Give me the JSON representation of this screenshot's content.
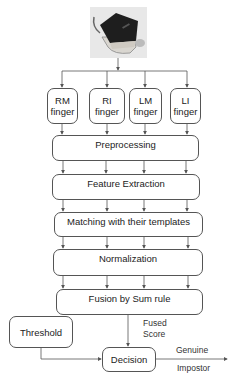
{
  "diagram": {
    "type": "flowchart",
    "input": {
      "name": "fingerprint-scanner-image"
    },
    "fingers": [
      {
        "line1": "RM",
        "line2": "finger"
      },
      {
        "line1": "RI",
        "line2": "finger"
      },
      {
        "line1": "LM",
        "line2": "finger"
      },
      {
        "line1": "LI",
        "line2": "finger"
      }
    ],
    "stages": [
      "Preprocessing",
      "Feature Extraction",
      "Matching with their templates",
      "Normalization",
      "Fusion by Sum rule"
    ],
    "threshold": "Threshold",
    "decision": "Decision",
    "fused_score": {
      "line1": "Fused",
      "line2": "Score"
    },
    "outputs": {
      "genuine": "Genuine",
      "impostor": "Impostor"
    }
  }
}
